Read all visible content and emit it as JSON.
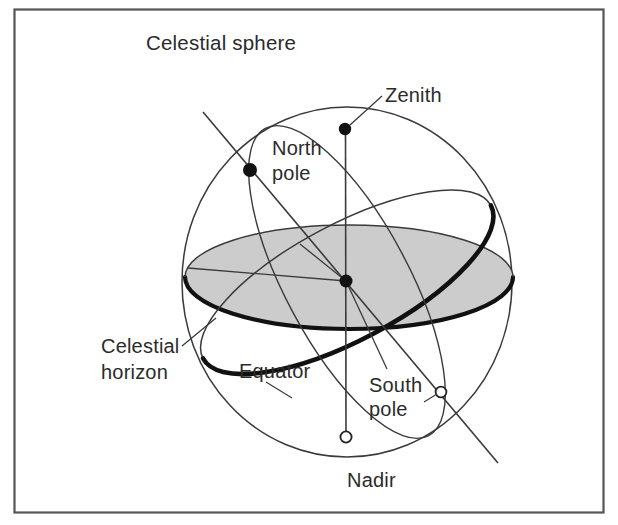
{
  "figure": {
    "title": "Celestial sphere",
    "border_color": "#555555",
    "background": "#ffffff",
    "horizon_fill": "#cccccc",
    "line_color": "#3a3a3a",
    "thick_line_color": "#111111"
  },
  "labels": {
    "title": "Celestial sphere",
    "zenith": "Zenith",
    "north_pole_line1": "North",
    "north_pole_line2": "pole",
    "celestial_horizon_line1": "Celestial",
    "celestial_horizon_line2": "horizon",
    "equator": "Equator",
    "south_pole_line1": "South",
    "south_pole_line2": "pole",
    "nadir": "Nadir"
  },
  "points": {
    "zenith": {
      "x": 345,
      "y": 129,
      "style": "filled"
    },
    "north_pole": {
      "x": 250,
      "y": 170,
      "style": "filled"
    },
    "observer_center": {
      "x": 346,
      "y": 281,
      "style": "filled"
    },
    "south_pole": {
      "x": 441,
      "y": 392,
      "style": "hollow"
    },
    "nadir": {
      "x": 346,
      "y": 437,
      "style": "hollow"
    }
  },
  "geometry": {
    "sphere_center_x": 347,
    "sphere_center_y": 282,
    "sphere_radius_x": 165,
    "sphere_radius_y": 175,
    "horizon_ellipse_rx": 164,
    "horizon_ellipse_ry": 52,
    "equator_tilt_deg": -28
  }
}
